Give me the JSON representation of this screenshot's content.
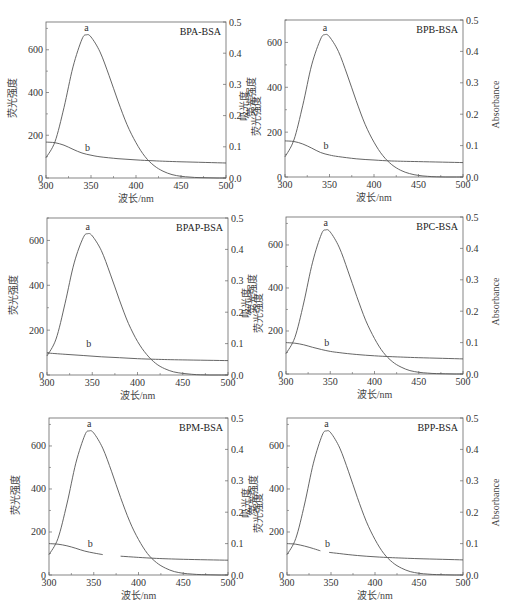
{
  "figure": {
    "caption_visible_text": "",
    "left_ylabel": "荧光强度",
    "right_ylabel_cn": "吸光度",
    "right_ylabel_en": "Absorbance",
    "xlabel": "波长/nm",
    "curve_labels": {
      "fluorescence": "a",
      "absorbance": "b"
    },
    "line_color": "#555555",
    "frame_color": "#666666"
  },
  "chart_data": [
    {
      "type": "line",
      "title": "BPA-BSA",
      "xlabel": "波长/nm",
      "ylabel": "荧光强度",
      "y2label": "吸光度",
      "xlim": [
        300,
        500
      ],
      "ylim": [
        0,
        730
      ],
      "y2lim": [
        0,
        0.5
      ],
      "xticks": [
        300,
        350,
        400,
        450,
        500
      ],
      "yticks": [
        0,
        200,
        400,
        600
      ],
      "y2ticks": [
        0.0,
        0.1,
        0.2,
        0.3,
        0.4,
        0.5
      ],
      "series": [
        {
          "name": "a",
          "axis": "left",
          "x": [
            300,
            310,
            320,
            330,
            340,
            345,
            350,
            360,
            370,
            380,
            390,
            400,
            410,
            420,
            430,
            440,
            450,
            460,
            470,
            480,
            490,
            500
          ],
          "y": [
            95,
            170,
            330,
            520,
            650,
            670,
            660,
            590,
            480,
            360,
            250,
            165,
            100,
            58,
            32,
            16,
            8,
            4,
            2,
            1,
            0,
            0
          ]
        },
        {
          "name": "b",
          "axis": "right",
          "x": [
            300,
            310,
            320,
            330,
            340,
            350,
            360,
            380,
            400,
            420,
            450,
            500
          ],
          "y": [
            0.115,
            0.113,
            0.105,
            0.092,
            0.08,
            0.073,
            0.068,
            0.062,
            0.058,
            0.055,
            0.052,
            0.048
          ]
        }
      ]
    },
    {
      "type": "line",
      "title": "BPB-BSA",
      "xlabel": "波长/nm",
      "ylabel": "荧光强度",
      "y2label": "Absorbance",
      "xlim": [
        300,
        500
      ],
      "ylim": [
        0,
        700
      ],
      "y2lim": [
        0,
        0.5
      ],
      "xticks": [
        300,
        350,
        400,
        450,
        500
      ],
      "yticks": [
        0,
        200,
        400,
        600
      ],
      "y2ticks": [
        0.0,
        0.1,
        0.2,
        0.3,
        0.4,
        0.5
      ],
      "series": [
        {
          "name": "a",
          "axis": "left",
          "x": [
            300,
            310,
            320,
            330,
            340,
            345,
            350,
            360,
            370,
            380,
            390,
            400,
            410,
            420,
            430,
            440,
            450,
            460,
            470,
            480,
            490,
            500
          ],
          "y": [
            90,
            165,
            320,
            500,
            615,
            635,
            625,
            560,
            455,
            340,
            235,
            155,
            95,
            55,
            30,
            15,
            7,
            3,
            1,
            0,
            0,
            0
          ]
        },
        {
          "name": "b",
          "axis": "right",
          "x": [
            300,
            310,
            320,
            330,
            340,
            350,
            360,
            380,
            400,
            420,
            450,
            500
          ],
          "y": [
            0.115,
            0.113,
            0.105,
            0.092,
            0.078,
            0.07,
            0.065,
            0.058,
            0.054,
            0.051,
            0.049,
            0.046
          ]
        }
      ]
    },
    {
      "type": "line",
      "title": "BPAP-BSA",
      "xlabel": "波长/nm",
      "ylabel": "荧光强度",
      "y2label": "吸光度",
      "xlim": [
        300,
        500
      ],
      "ylim": [
        0,
        700
      ],
      "y2lim": [
        0,
        0.5
      ],
      "xticks": [
        300,
        350,
        400,
        450,
        500
      ],
      "yticks": [
        0,
        200,
        400,
        600
      ],
      "y2ticks": [
        0.0,
        0.1,
        0.2,
        0.3,
        0.4,
        0.5
      ],
      "series": [
        {
          "name": "a",
          "axis": "left",
          "x": [
            300,
            310,
            320,
            330,
            340,
            345,
            350,
            360,
            370,
            380,
            390,
            400,
            410,
            420,
            430,
            440,
            450,
            460,
            470,
            480,
            490,
            500
          ],
          "y": [
            85,
            160,
            320,
            500,
            612,
            630,
            620,
            555,
            450,
            335,
            230,
            150,
            92,
            52,
            28,
            14,
            7,
            3,
            1,
            0,
            0,
            0
          ]
        },
        {
          "name": "b",
          "axis": "right",
          "x": [
            300,
            320,
            340,
            360,
            380,
            400,
            420,
            450,
            500
          ],
          "y": [
            0.07,
            0.066,
            0.062,
            0.058,
            0.055,
            0.052,
            0.05,
            0.048,
            0.046
          ]
        }
      ]
    },
    {
      "type": "line",
      "title": "BPC-BSA",
      "xlabel": "波长/nm",
      "ylabel": "荧光强度",
      "y2label": "Absorbance",
      "xlim": [
        300,
        500
      ],
      "ylim": [
        0,
        730
      ],
      "y2lim": [
        0,
        0.5
      ],
      "xticks": [
        300,
        350,
        400,
        450,
        500
      ],
      "yticks": [
        0,
        200,
        400,
        600
      ],
      "y2ticks": [
        0.0,
        0.1,
        0.2,
        0.3,
        0.4,
        0.5
      ],
      "series": [
        {
          "name": "a",
          "axis": "left",
          "x": [
            300,
            310,
            320,
            330,
            340,
            345,
            350,
            360,
            370,
            380,
            390,
            400,
            410,
            420,
            430,
            440,
            450,
            460,
            470,
            480,
            490,
            500
          ],
          "y": [
            95,
            170,
            330,
            520,
            650,
            670,
            660,
            590,
            480,
            360,
            250,
            165,
            100,
            58,
            32,
            16,
            8,
            4,
            2,
            1,
            0,
            0
          ]
        },
        {
          "name": "b",
          "axis": "right",
          "x": [
            300,
            310,
            320,
            330,
            340,
            350,
            360,
            380,
            400,
            420,
            450,
            500
          ],
          "y": [
            0.1,
            0.098,
            0.093,
            0.085,
            0.078,
            0.072,
            0.068,
            0.062,
            0.058,
            0.055,
            0.052,
            0.048
          ]
        }
      ]
    },
    {
      "type": "line",
      "title": "BPM-BSA",
      "xlabel": "波长/nm",
      "ylabel": "荧光强度",
      "y2label": "吸光度",
      "xlim": [
        300,
        500
      ],
      "ylim": [
        0,
        730
      ],
      "y2lim": [
        0,
        0.5
      ],
      "xticks": [
        300,
        350,
        400,
        450,
        500
      ],
      "yticks": [
        0,
        200,
        400,
        600
      ],
      "y2ticks": [
        0.0,
        0.1,
        0.2,
        0.3,
        0.4,
        0.5
      ],
      "series": [
        {
          "name": "a",
          "axis": "left",
          "x": [
            300,
            310,
            320,
            330,
            340,
            345,
            350,
            360,
            370,
            380,
            390,
            400,
            410,
            420,
            430,
            440,
            450,
            460,
            470,
            480,
            490,
            500
          ],
          "y": [
            95,
            170,
            330,
            520,
            650,
            670,
            660,
            590,
            480,
            360,
            250,
            165,
            100,
            58,
            32,
            16,
            8,
            4,
            2,
            1,
            0,
            0
          ]
        },
        {
          "name": "b",
          "axis": "right",
          "gap": [
            360,
            380
          ],
          "x": [
            300,
            310,
            320,
            330,
            340,
            350,
            360,
            380,
            400,
            420,
            450,
            500
          ],
          "y": [
            0.1,
            0.098,
            0.093,
            0.085,
            0.076,
            0.07,
            0.065,
            0.06,
            0.056,
            0.053,
            0.05,
            0.047
          ]
        }
      ]
    },
    {
      "type": "line",
      "title": "BPP-BSA",
      "xlabel": "波长/nm",
      "ylabel": "荧光强度",
      "y2label": "Absorbance",
      "xlim": [
        300,
        500
      ],
      "ylim": [
        0,
        730
      ],
      "y2lim": [
        0,
        0.5
      ],
      "xticks": [
        300,
        350,
        400,
        450,
        500
      ],
      "yticks": [
        0,
        200,
        400,
        600
      ],
      "y2ticks": [
        0.0,
        0.1,
        0.2,
        0.3,
        0.4,
        0.5
      ],
      "series": [
        {
          "name": "a",
          "axis": "left",
          "x": [
            300,
            310,
            320,
            330,
            340,
            345,
            350,
            360,
            370,
            380,
            390,
            400,
            410,
            420,
            430,
            440,
            450,
            460,
            470,
            480,
            490,
            500
          ],
          "y": [
            95,
            170,
            330,
            520,
            650,
            670,
            660,
            590,
            480,
            360,
            250,
            165,
            100,
            58,
            32,
            16,
            8,
            4,
            2,
            1,
            0,
            0
          ]
        },
        {
          "name": "b",
          "axis": "right",
          "gap": [
            338,
            348
          ],
          "x": [
            300,
            310,
            320,
            330,
            338,
            348,
            360,
            380,
            400,
            420,
            450,
            500
          ],
          "y": [
            0.1,
            0.098,
            0.092,
            0.084,
            0.077,
            0.072,
            0.068,
            0.062,
            0.058,
            0.055,
            0.052,
            0.048
          ]
        }
      ]
    }
  ]
}
